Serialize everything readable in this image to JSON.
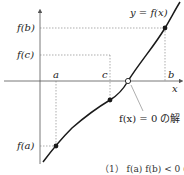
{
  "diagram": {
    "curve_label": "y = f(x)",
    "x_axis_label": "x",
    "x_ticks": [
      {
        "name": "a",
        "x": 56
      },
      {
        "name": "c",
        "x": 110
      },
      {
        "name": "b",
        "x": 165
      }
    ],
    "y_ticks": [
      {
        "name": "f(b)",
        "y": 28
      },
      {
        "name": "f(c)",
        "y": 55
      },
      {
        "name": "f(a)",
        "y": 146
      }
    ],
    "labels": {
      "a": "a",
      "b": "b",
      "c": "c",
      "fa": "f(a)",
      "fb": "f(b)",
      "fc": "f(c)",
      "x": "x",
      "curve": "y = f(x)",
      "root_annotation": "f(x) = 0 の解",
      "caption": "（1）  f(a) f(b) < 0 の場合"
    },
    "points": [
      {
        "name": "point-a",
        "x": 56,
        "y": 146,
        "filled": true
      },
      {
        "name": "point-c",
        "x": 110,
        "y": 100,
        "filled": true
      },
      {
        "name": "point-b",
        "x": 165,
        "y": 28,
        "filled": true
      },
      {
        "name": "root",
        "x": 128,
        "y": 81,
        "filled": false
      }
    ],
    "colors": {
      "line": "#1a1a1a",
      "axis": "#555555",
      "dashed": "#777777",
      "background": "#ffffff"
    }
  }
}
